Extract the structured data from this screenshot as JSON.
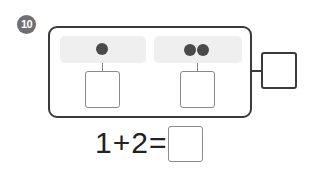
{
  "problem": {
    "number": "10",
    "badge_color": "#6f6f6f",
    "groups": [
      {
        "dots": 1,
        "answer": ""
      },
      {
        "dots": 2,
        "answer": ""
      }
    ],
    "total_answer": "",
    "equation": {
      "text": "1+2=",
      "answer": ""
    }
  }
}
